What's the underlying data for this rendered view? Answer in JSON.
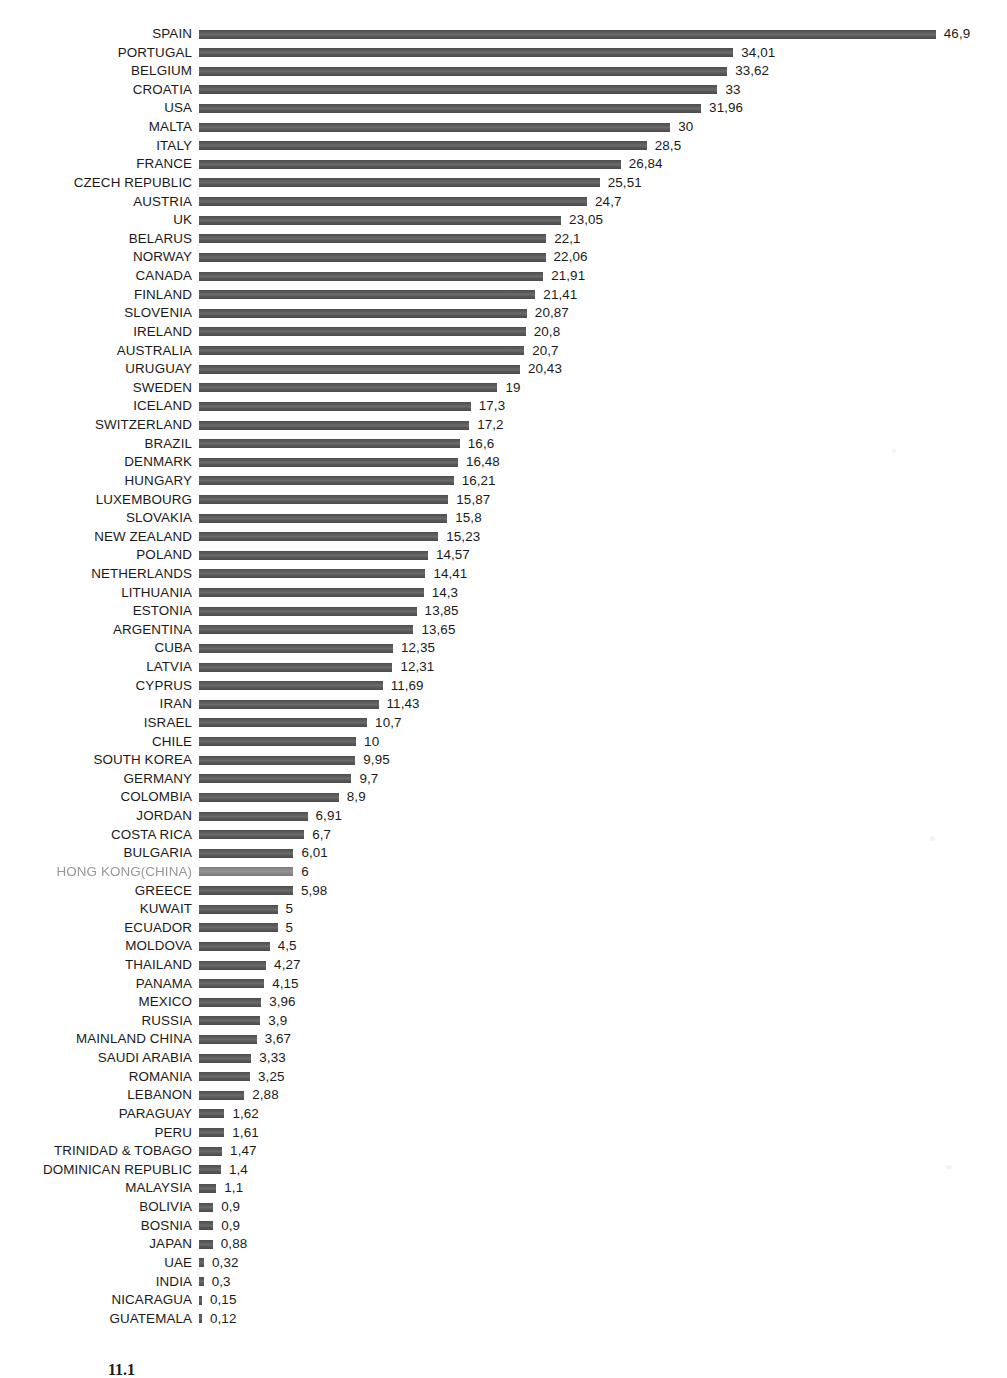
{
  "chart_data": {
    "type": "bar",
    "orientation": "horizontal",
    "title": "",
    "subtitle": "",
    "xlabel": "",
    "ylabel": "",
    "xlim": [
      0,
      46.9
    ],
    "grid": false,
    "legend": null,
    "decimal_separator": ",",
    "bar_color": "#555555",
    "categories": [
      "SPAIN",
      "PORTUGAL",
      "BELGIUM",
      "CROATIA",
      "USA",
      "MALTA",
      "ITALY",
      "FRANCE",
      "CZECH REPUBLIC",
      "AUSTRIA",
      "UK",
      "BELARUS",
      "NORWAY",
      "CANADA",
      "FINLAND",
      "SLOVENIA",
      "IRELAND",
      "AUSTRALIA",
      "URUGUAY",
      "SWEDEN",
      "ICELAND",
      "SWITZERLAND",
      "BRAZIL",
      "DENMARK",
      "HUNGARY",
      "LUXEMBOURG",
      "SLOVAKIA",
      "NEW ZEALAND",
      "POLAND",
      "NETHERLANDS",
      "LITHUANIA",
      "ESTONIA",
      "ARGENTINA",
      "CUBA",
      "LATVIA",
      "CYPRUS",
      "IRAN",
      "ISRAEL",
      "CHILE",
      "SOUTH KOREA",
      "GERMANY",
      "COLOMBIA",
      "JORDAN",
      "COSTA RICA",
      "BULGARIA",
      "HONG KONG(CHINA)",
      "GREECE",
      "KUWAIT",
      "ECUADOR",
      "MOLDOVA",
      "THAILAND",
      "PANAMA",
      "MEXICO",
      "RUSSIA",
      "MAINLAND CHINA",
      "SAUDI ARABIA",
      "ROMANIA",
      "LEBANON",
      "PARAGUAY",
      "PERU",
      "TRINIDAD & TOBAGO",
      "DOMINICAN REPUBLIC",
      "MALAYSIA",
      "BOLIVIA",
      "BOSNIA",
      "JAPAN",
      "UAE",
      "INDIA",
      "NICARAGUA",
      "GUATEMALA"
    ],
    "values": [
      46.9,
      34.01,
      33.62,
      33,
      31.96,
      30,
      28.5,
      26.84,
      25.51,
      24.7,
      23.05,
      22.1,
      22.06,
      21.91,
      21.41,
      20.87,
      20.8,
      20.7,
      20.43,
      19,
      17.3,
      17.2,
      16.6,
      16.48,
      16.21,
      15.87,
      15.8,
      15.23,
      14.57,
      14.41,
      14.3,
      13.85,
      13.65,
      12.35,
      12.31,
      11.69,
      11.43,
      10.7,
      10,
      9.95,
      9.7,
      8.9,
      6.91,
      6.7,
      6.01,
      6,
      5.98,
      5,
      5,
      4.5,
      4.27,
      4.15,
      3.96,
      3.9,
      3.67,
      3.33,
      3.25,
      2.88,
      1.62,
      1.61,
      1.47,
      1.4,
      1.1,
      0.9,
      0.9,
      0.88,
      0.32,
      0.3,
      0.15,
      0.12
    ],
    "value_labels": [
      "46,9",
      "34,01",
      "33,62",
      "33",
      "31,96",
      "30",
      "28,5",
      "26,84",
      "25,51",
      "24,7",
      "23,05",
      "22,1",
      "22,06",
      "21,91",
      "21,41",
      "20,87",
      "20,8",
      "20,7",
      "20,43",
      "19",
      "17,3",
      "17,2",
      "16,6",
      "16,48",
      "16,21",
      "15,87",
      "15,8",
      "15,23",
      "14,57",
      "14,41",
      "14,3",
      "13,85",
      "13,65",
      "12,35",
      "12,31",
      "11,69",
      "11,43",
      "10,7",
      "10",
      "9,95",
      "9,7",
      "8,9",
      "6,91",
      "6,7",
      "6,01",
      "6",
      "5,98",
      "5",
      "5",
      "4,5",
      "4,27",
      "4,15",
      "3,96",
      "3,9",
      "3,67",
      "3,33",
      "3,25",
      "2,88",
      "1,62",
      "1,61",
      "1,47",
      "1,4",
      "1,1",
      "0,9",
      "0,9",
      "0,88",
      "0,32",
      "0,3",
      "0,15",
      "0,12"
    ],
    "faded_category_index": 45
  },
  "caption": {
    "number": "11.1",
    "text": ""
  }
}
